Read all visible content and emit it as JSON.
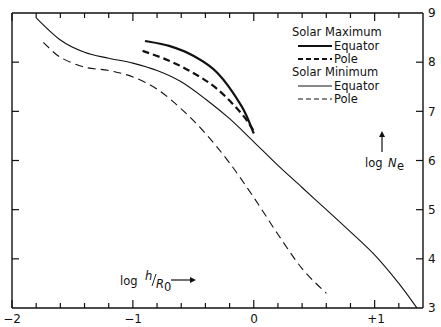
{
  "chart_data": {
    "type": "line",
    "title": "",
    "xlabel": "log h/R0",
    "ylabel": "log Ne",
    "xlim": [
      -2,
      1.4
    ],
    "ylim": [
      3,
      9
    ],
    "x_ticks": [
      "-2",
      "-1",
      "0",
      "+1"
    ],
    "y_ticks": [
      "3",
      "4",
      "5",
      "6",
      "7",
      "8",
      "9"
    ],
    "grid": false,
    "legend_position": "upper right",
    "legend": {
      "groups": [
        {
          "title": "Solar Maximum",
          "entries": [
            {
              "label": "Equator",
              "style": "solid-thick"
            },
            {
              "label": "Pole",
              "style": "dashed-thick"
            }
          ]
        },
        {
          "title": "Solar Minimum",
          "entries": [
            {
              "label": "Equator",
              "style": "solid-thin"
            },
            {
              "label": "Pole",
              "style": "dashed-thin"
            }
          ]
        }
      ]
    },
    "series": [
      {
        "name": "Solar Maximum Equator",
        "style": "solid-thick",
        "x": [
          -0.9,
          -0.7,
          -0.5,
          -0.3,
          -0.1,
          0.0
        ],
        "y": [
          8.43,
          8.33,
          8.13,
          7.78,
          7.1,
          6.55
        ]
      },
      {
        "name": "Solar Maximum Pole",
        "style": "dashed-thick",
        "x": [
          -0.92,
          -0.7,
          -0.5,
          -0.3,
          -0.1,
          0.0
        ],
        "y": [
          8.23,
          8.03,
          7.78,
          7.45,
          6.95,
          6.6
        ]
      },
      {
        "name": "Solar Minimum Equator",
        "style": "solid-thin",
        "x": [
          -1.8,
          -1.6,
          -1.4,
          -1.2,
          -1.0,
          -0.8,
          -0.6,
          -0.4,
          -0.2,
          0.0,
          0.2,
          0.4,
          0.6,
          0.8,
          1.0,
          1.2,
          1.35
        ],
        "y": [
          8.9,
          8.45,
          8.2,
          8.08,
          7.98,
          7.83,
          7.6,
          7.25,
          6.85,
          6.38,
          5.9,
          5.45,
          5.0,
          4.55,
          4.08,
          3.5,
          3.0
        ]
      },
      {
        "name": "Solar Minimum Pole",
        "style": "dashed-thin",
        "x": [
          -1.74,
          -1.6,
          -1.4,
          -1.2,
          -1.0,
          -0.8,
          -0.6,
          -0.4,
          -0.2,
          0.0,
          0.2,
          0.4,
          0.6
        ],
        "y": [
          8.4,
          8.1,
          7.9,
          7.83,
          7.7,
          7.45,
          7.05,
          6.55,
          5.95,
          5.25,
          4.5,
          3.8,
          3.3
        ]
      }
    ],
    "annotations": [
      {
        "text": "log h/R0 →",
        "x": -0.95,
        "y": 3.7
      },
      {
        "text": "log Ne ↑",
        "x": 1.18,
        "y": 6.3
      }
    ]
  },
  "labels": {
    "x_axis": {
      "prefix": "log",
      "h": "h",
      "r": "R",
      "sub": "0"
    },
    "y_axis": {
      "prefix": "log",
      "n": "N",
      "sub": "e"
    },
    "legend": {
      "max_title": "Solar Maximum",
      "max_equator": "Equator",
      "max_pole": "Pole",
      "min_title": "Solar Minimum",
      "min_equator": "Equator",
      "min_pole": "Pole"
    },
    "x_ticks": [
      "−2",
      "−1",
      "0",
      "+1"
    ],
    "y_ticks": [
      "9",
      "8",
      "7",
      "6",
      "5",
      "4",
      "3"
    ]
  }
}
